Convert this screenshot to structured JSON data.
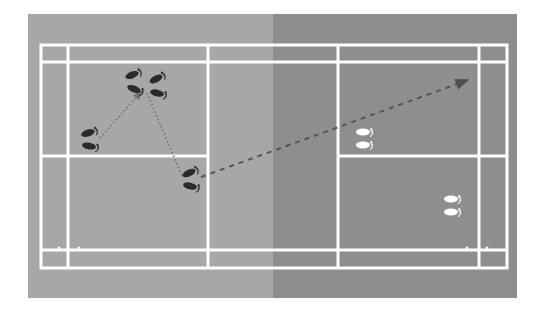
{
  "diagram": {
    "type": "badminton-court-footwork",
    "colors": {
      "page_background": "#ffffff",
      "left_half": "#a7a7a7",
      "right_half": "#8e8e8e",
      "court_lines": "#ffffff",
      "player_feet": "#2a2a2a",
      "opponent_feet": "#ffffff",
      "movement_path": "#6e6e6e",
      "shot_path": "#555555"
    },
    "court": {
      "background": {
        "x": 28,
        "y": 14,
        "width": 489,
        "height": 284
      },
      "net_x": 273,
      "outer": {
        "x1": 41,
        "y1": 45,
        "x2": 507,
        "y2": 268
      },
      "singles_sidelines_y": [
        62,
        250
      ],
      "long_service_lines_x": [
        68,
        479
      ],
      "short_service_lines_x": [
        208,
        338
      ],
      "center_line_y": 156
    },
    "player": {
      "label": "player-footprints",
      "positions": [
        {
          "name": "rear-forehand-start",
          "x": 88,
          "y": 139
        },
        {
          "name": "center-base-left",
          "x": 134,
          "y": 82
        },
        {
          "name": "center-base-right",
          "x": 156,
          "y": 85
        },
        {
          "name": "front-hit",
          "x": 190,
          "y": 179
        }
      ]
    },
    "opponent": {
      "label": "opponent-footprints",
      "positions": [
        {
          "name": "opponent-front",
          "x": 360,
          "y": 138
        },
        {
          "name": "opponent-back",
          "x": 450,
          "y": 205
        }
      ]
    },
    "paths": [
      {
        "name": "move-to-base",
        "style": "dotted",
        "from": [
          100,
          138
        ],
        "to": [
          141,
          92
        ]
      },
      {
        "name": "move-to-front",
        "style": "dotted",
        "from": [
          146,
          92
        ],
        "to": [
          182,
          175
        ]
      },
      {
        "name": "shot-clear",
        "style": "dashed",
        "from": [
          200,
          178
        ],
        "to": [
          468,
          80
        ]
      }
    ]
  }
}
